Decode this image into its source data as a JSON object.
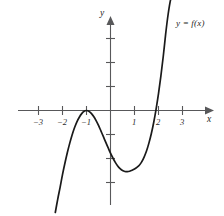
{
  "figure": {
    "background_color": "#ffffff",
    "axis_color": "#58585a",
    "curve_color": "#1a1a1a"
  },
  "labels": {
    "x_axis": "x",
    "y_axis": "y",
    "curve": "y = f(x)"
  },
  "ticks": {
    "x": [
      "−3",
      "−2",
      "−1",
      "1",
      "2",
      "3"
    ],
    "y_count_above": 3,
    "y_count_below": 3
  },
  "chart_data": {
    "type": "line",
    "title": "",
    "xlabel": "x",
    "ylabel": "y",
    "legend": [
      "y = f(x)"
    ],
    "legend_position": "upper-right",
    "grid": false,
    "xlim": [
      -3.9,
      4.3
    ],
    "ylim": [
      -4.1,
      4.1
    ],
    "xticks": [
      -3,
      -2,
      -1,
      1,
      2,
      3
    ],
    "xticklabels": [
      "−3",
      "−2",
      "−1",
      "1",
      "2",
      "3"
    ],
    "yticks": [
      -3,
      -2,
      -1,
      1,
      2,
      3
    ],
    "yticklabels": [
      "",
      "",
      "",
      "",
      "",
      ""
    ],
    "annotations": [
      {
        "text": "y = f(x)",
        "x": 2.9,
        "y": 3.6
      }
    ],
    "features": {
      "local_maximum": {
        "x": -1.0,
        "y": 0.0
      },
      "local_minimum": {
        "x": 1.05,
        "y": -1.6
      },
      "x_intercepts": [
        -1.0,
        2.0
      ],
      "y_intercept": -0.5,
      "end_behavior": "decreasing to -infinity on the left, increasing to +infinity on the right"
    },
    "series": [
      {
        "name": "y = f(x)",
        "x": [
          -2.3,
          -2.2,
          -2.1,
          -2.0,
          -1.9,
          -1.8,
          -1.7,
          -1.6,
          -1.5,
          -1.4,
          -1.3,
          -1.2,
          -1.1,
          -1.0,
          -0.9,
          -0.8,
          -0.7,
          -0.6,
          -0.5,
          -0.4,
          -0.3,
          -0.2,
          -0.1,
          0.0,
          0.1,
          0.2,
          0.3,
          0.4,
          0.5,
          0.6,
          0.7,
          0.8,
          0.9,
          1.0,
          1.1,
          1.2,
          1.3,
          1.4,
          1.5,
          1.6,
          1.7,
          1.8,
          1.9,
          2.0,
          2.1,
          2.2,
          2.3,
          2.4,
          2.5,
          2.6,
          2.65
        ],
        "y": [
          -4.25,
          -3.7,
          -3.2,
          -2.67,
          -2.2,
          -1.76,
          -1.37,
          -1.02,
          -0.72,
          -0.47,
          -0.28,
          -0.13,
          -0.03,
          0.0,
          -0.03,
          -0.12,
          -0.25,
          -0.42,
          -0.62,
          -0.85,
          -1.08,
          -1.32,
          -1.55,
          -1.78,
          -1.98,
          -2.16,
          -2.31,
          -2.42,
          -2.5,
          -2.54,
          -2.55,
          -2.53,
          -2.49,
          -2.44,
          -2.37,
          -2.28,
          -2.14,
          -1.94,
          -1.69,
          -1.36,
          -0.97,
          -0.5,
          0.06,
          0.7,
          1.44,
          2.27,
          3.2,
          4.0,
          4.6,
          4.95,
          5.1
        ]
      }
    ]
  }
}
